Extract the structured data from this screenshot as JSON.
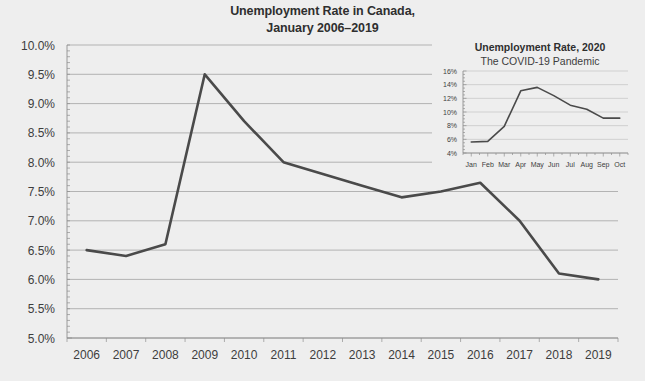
{
  "chart_data": [
    {
      "id": "main",
      "type": "line",
      "title": "Unemployment Rate in Canada,",
      "subtitle": "January 2006–2019",
      "title_lines": [
        "Unemployment Rate in Canada,",
        "January 2006–2019"
      ],
      "xlabel": "",
      "ylabel": "",
      "categories": [
        "2006",
        "2007",
        "2008",
        "2009",
        "2010",
        "2011",
        "2012",
        "2013",
        "2014",
        "2015",
        "2016",
        "2017",
        "2018",
        "2019"
      ],
      "x": [
        2006,
        2007,
        2008,
        2009,
        2010,
        2011,
        2012,
        2013,
        2014,
        2015,
        2016,
        2017,
        2018,
        2019
      ],
      "values": [
        6.5,
        6.4,
        6.6,
        9.5,
        8.7,
        8.0,
        7.8,
        7.6,
        7.4,
        7.5,
        7.65,
        7.0,
        6.1,
        6.0
      ],
      "ylim": [
        5.0,
        10.0
      ],
      "ytick_values": [
        10.0,
        9.5,
        9.0,
        8.5,
        8.0,
        7.5,
        7.0,
        6.5,
        6.0,
        5.5,
        5.0
      ],
      "ytick_labels": [
        "10.0%",
        "9.5%",
        "9.0%",
        "8.5%",
        "8.0%",
        "7.5%",
        "7.0%",
        "6.5%",
        "6.0%",
        "5.5%",
        "5.0%"
      ],
      "grid": true,
      "legend": "none",
      "line_color": "#4a4a4a"
    },
    {
      "id": "inset",
      "type": "line",
      "title": "Unemployment Rate, 2020",
      "subtitle": "The COVID-19 Pandemic",
      "title_lines": [
        "Unemployment Rate, 2020",
        "The COVID-19 Pandemic"
      ],
      "xlabel": "",
      "ylabel": "",
      "categories": [
        "Jan",
        "Feb",
        "Mar",
        "Apr",
        "May",
        "Jun",
        "Jul",
        "Aug",
        "Sep",
        "Oct"
      ],
      "values": [
        5.6,
        5.7,
        7.9,
        13.1,
        13.6,
        12.4,
        11.0,
        10.4,
        9.1,
        9.1
      ],
      "ylim": [
        4,
        16
      ],
      "ytick_values": [
        16,
        14,
        12,
        10,
        8,
        6,
        4
      ],
      "ytick_labels": [
        "16%",
        "14%",
        "12%",
        "10%",
        "8%",
        "6%",
        "4%"
      ],
      "grid": true,
      "legend": "none",
      "line_color": "#4a4a4a"
    }
  ],
  "colors": {
    "background": "#eeeeee",
    "line": "#4a4a4a",
    "grid": "#9a9a9a",
    "text": "#3d3d3d"
  }
}
